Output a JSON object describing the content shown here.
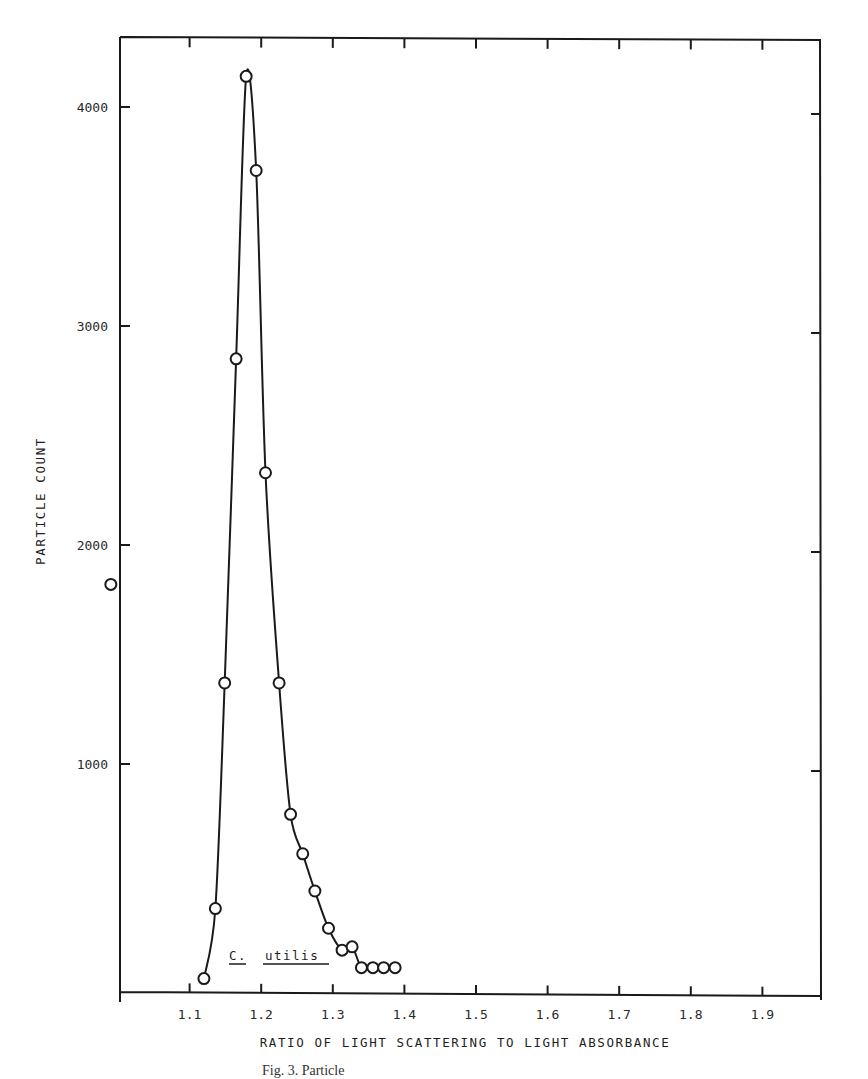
{
  "chart_data": {
    "type": "line",
    "title": "",
    "xlabel": "RATIO OF LIGHT SCATTERING TO LIGHT ABSORBANCE",
    "ylabel": "PARTICLE COUNT",
    "annotation": {
      "text_genus": "C.",
      "text_species": "utilis",
      "x": 1.15,
      "y": 130
    },
    "x_ticks": [
      "1.1",
      "1.2",
      "1.3",
      "1.4",
      "1.5",
      "1.6",
      "1.7",
      "1.8",
      "1.9"
    ],
    "y_ticks": [
      "1000",
      "2000",
      "3000",
      "4000"
    ],
    "xlim": [
      1.0,
      2.0
    ],
    "ylim": [
      0,
      4500
    ],
    "grid": false,
    "legend": null,
    "series": [
      {
        "name": "C. utilis",
        "marker": "open-circle",
        "points": [
          [
            1.12,
            20
          ],
          [
            1.136,
            340
          ],
          [
            1.149,
            1370
          ],
          [
            1.165,
            2850
          ],
          [
            1.179,
            4140
          ],
          [
            1.193,
            3710
          ],
          [
            1.206,
            2330
          ],
          [
            1.225,
            1370
          ],
          [
            1.241,
            770
          ],
          [
            1.258,
            590
          ],
          [
            1.275,
            420
          ],
          [
            1.294,
            250
          ],
          [
            1.313,
            150
          ],
          [
            1.327,
            165
          ],
          [
            1.34,
            70
          ],
          [
            1.356,
            70
          ],
          [
            1.371,
            70
          ],
          [
            1.387,
            70
          ]
        ]
      },
      {
        "name": "isolated point",
        "marker": "open-circle",
        "points": [
          [
            0.99,
            1820
          ]
        ]
      }
    ]
  },
  "caption": "Fig. 3.   Particle",
  "colors": {
    "ink": "#1a1a1a",
    "background": "#ffffff"
  }
}
